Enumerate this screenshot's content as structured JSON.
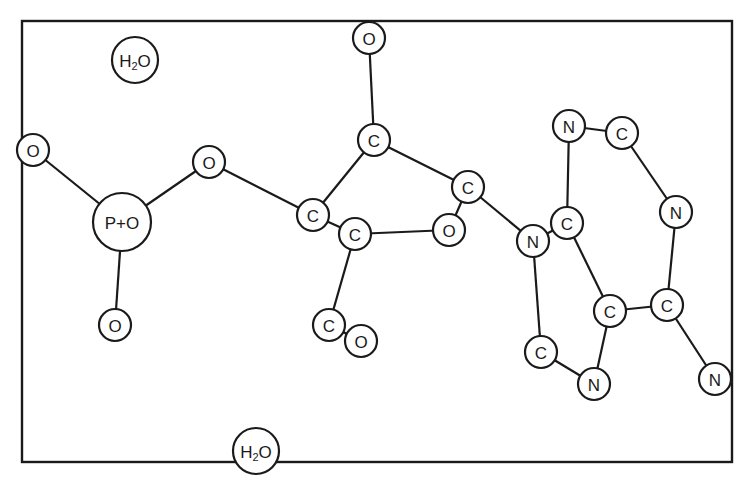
{
  "frame": {
    "x": 22,
    "y": 21,
    "width": 710,
    "height": 441
  },
  "colors": {
    "stroke": "#1a1a1a",
    "fill": "#ffffff",
    "background": "#ffffff"
  },
  "atoms": [
    {
      "id": "h2o_top",
      "label": "H2O",
      "main": "H",
      "sub": "2",
      "tail": "O",
      "x": 135,
      "y": 60,
      "r": 23
    },
    {
      "id": "o_phos_left",
      "label": "O",
      "x": 33,
      "y": 150,
      "r": 16
    },
    {
      "id": "p",
      "label": "P+O",
      "x": 122,
      "y": 222,
      "r": 29
    },
    {
      "id": "o_ester",
      "label": "O",
      "x": 209,
      "y": 162,
      "r": 16
    },
    {
      "id": "o_phos_bottom",
      "label": "O",
      "x": 115,
      "y": 325,
      "r": 16
    },
    {
      "id": "o_top",
      "label": "O",
      "x": 369,
      "y": 38,
      "r": 16
    },
    {
      "id": "c_top",
      "label": "C",
      "x": 374,
      "y": 140,
      "r": 16
    },
    {
      "id": "c_left",
      "label": "C",
      "x": 313,
      "y": 215,
      "r": 16
    },
    {
      "id": "c_sugar",
      "label": "C",
      "x": 355,
      "y": 234,
      "r": 16
    },
    {
      "id": "o_ring",
      "label": "O",
      "x": 449,
      "y": 230,
      "r": 16
    },
    {
      "id": "c_ring_right",
      "label": "C",
      "x": 468,
      "y": 187,
      "r": 16
    },
    {
      "id": "n9",
      "label": "N",
      "x": 533,
      "y": 241,
      "r": 16
    },
    {
      "id": "c4",
      "label": "C",
      "x": 567,
      "y": 223,
      "r": 16
    },
    {
      "id": "n3",
      "label": "N",
      "x": 569,
      "y": 126,
      "r": 16
    },
    {
      "id": "c2",
      "label": "C",
      "x": 622,
      "y": 133,
      "r": 16
    },
    {
      "id": "n1",
      "label": "N",
      "x": 676,
      "y": 212,
      "r": 16
    },
    {
      "id": "c5",
      "label": "C",
      "x": 610,
      "y": 311,
      "r": 16
    },
    {
      "id": "c6",
      "label": "C",
      "x": 667,
      "y": 305,
      "r": 16
    },
    {
      "id": "n6",
      "label": "N",
      "x": 715,
      "y": 379,
      "r": 16
    },
    {
      "id": "c8",
      "label": "C",
      "x": 541,
      "y": 352,
      "r": 16
    },
    {
      "id": "n7",
      "label": "N",
      "x": 594,
      "y": 384,
      "r": 16
    },
    {
      "id": "c_low",
      "label": "C",
      "x": 329,
      "y": 325,
      "r": 16
    },
    {
      "id": "o_low",
      "label": "O",
      "x": 361,
      "y": 341,
      "r": 16
    },
    {
      "id": "h2o_bottom",
      "label": "H2O",
      "main": "H",
      "sub": "2",
      "tail": "O",
      "x": 256,
      "y": 451,
      "r": 23
    }
  ],
  "bonds": [
    [
      "o_phos_left",
      "p"
    ],
    [
      "p",
      "o_ester"
    ],
    [
      "p",
      "o_phos_bottom"
    ],
    [
      "o_ester",
      "c_left"
    ],
    [
      "o_top",
      "c_top"
    ],
    [
      "c_top",
      "c_left"
    ],
    [
      "c_top",
      "c_ring_right"
    ],
    [
      "c_left",
      "c_sugar"
    ],
    [
      "c_sugar",
      "o_ring"
    ],
    [
      "o_ring",
      "c_ring_right"
    ],
    [
      "c_ring_right",
      "n9"
    ],
    [
      "c_sugar",
      "c_low"
    ],
    [
      "c_low",
      "o_low"
    ],
    [
      "n9",
      "c4"
    ],
    [
      "n9",
      "c8"
    ],
    [
      "c4",
      "n3"
    ],
    [
      "c4",
      "c5"
    ],
    [
      "n3",
      "c2"
    ],
    [
      "c2",
      "n1"
    ],
    [
      "n1",
      "c6"
    ],
    [
      "c5",
      "c6"
    ],
    [
      "c6",
      "n6"
    ],
    [
      "c5",
      "n7"
    ],
    [
      "c8",
      "n7"
    ]
  ]
}
